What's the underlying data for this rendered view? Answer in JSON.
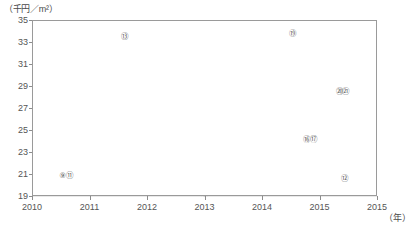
{
  "axes": {
    "y_unit": "（千円／m²）",
    "x_unit": "（年）"
  },
  "chart_data": {
    "type": "line",
    "title": "",
    "xlabel": "（年）",
    "ylabel": "（千円／m²）",
    "ylim": [
      19,
      35
    ],
    "xlim": [
      0,
      6
    ],
    "grid": true,
    "legend": "annotations-inline",
    "yticks": [
      35,
      33,
      31,
      29,
      27,
      25,
      23,
      21,
      19
    ],
    "categories": [
      "2010",
      "2011",
      "2012",
      "2013",
      "2014",
      "2015",
      "2015"
    ],
    "series": [
      {
        "name": "⑬",
        "style": "fine-dotted",
        "label": "⑬",
        "values": [
          31.9,
          31.9,
          31.8,
          31.7,
          31.6,
          31.3,
          30.9
        ]
      },
      {
        "name": "⑲",
        "style": "long-dash",
        "label": "⑲",
        "values": [
          30.0,
          30.0,
          30.0,
          28.9,
          30.0,
          31.8,
          33.4
        ]
      },
      {
        "name": "⑳㉑",
        "style": "dash-dot",
        "label": "⑳㉑",
        "values": [
          30.0,
          30.0,
          30.0,
          28.9,
          29.6,
          31.2,
          32.8
        ]
      },
      {
        "name": "㉒㉓",
        "style": "dash-dot-low",
        "label": "",
        "values": [
          30.0,
          30.0,
          30.0,
          28.9,
          29.2,
          30.3,
          31.9
        ]
      },
      {
        "name": "⑯⑰",
        "style": "dash-dot-thin",
        "label": "⑯⑰",
        "values": [
          22.0,
          22.0,
          22.0,
          21.0,
          21.0,
          21.4,
          22.1
        ]
      },
      {
        "name": "solid-flat",
        "style": "solid",
        "label": "",
        "values": [
          21.0,
          21.0,
          21.0,
          21.0,
          21.0,
          21.0,
          21.0
        ]
      },
      {
        "name": "⑨⑪ / ⑫",
        "style": "light-dotted",
        "label": "⑫",
        "values": [
          20.9,
          20.3,
          19.7,
          19.0,
          19.6,
          20.0,
          19.9
        ]
      }
    ],
    "annotations": [
      {
        "text": "⑬",
        "x_frac": 0.268,
        "y_frac": 0.098
      },
      {
        "text": "⑲",
        "x_frac": 0.755,
        "y_frac": 0.078
      },
      {
        "text": "⑳㉑",
        "x_frac": 0.9,
        "y_frac": 0.408
      },
      {
        "text": "⑯⑰",
        "x_frac": 0.805,
        "y_frac": 0.68
      },
      {
        "text": "⑨⑪",
        "x_frac": 0.098,
        "y_frac": 0.885
      },
      {
        "text": "⑫",
        "x_frac": 0.905,
        "y_frac": 0.905
      }
    ]
  }
}
